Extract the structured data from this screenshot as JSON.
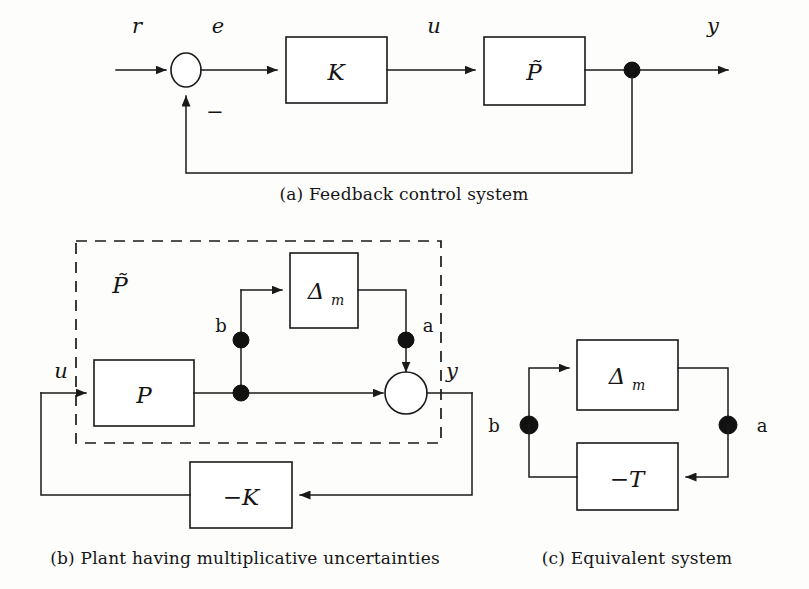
{
  "figure": {
    "background_color": "#fdfdfc",
    "line_color": "#1a1a1a"
  },
  "panel_a": {
    "caption": "(a) Feedback control system",
    "labels": {
      "reference": "r",
      "error": "e",
      "control": "u",
      "output": "y",
      "minus_sign": "−"
    },
    "blocks": [
      {
        "name": "controller",
        "label": "K"
      },
      {
        "name": "uncertain-plant",
        "label": "P̃"
      }
    ],
    "summing_junction": {
      "name": "summing-junction",
      "signs": [
        "+",
        "−"
      ]
    },
    "takeoff_node": {
      "name": "output-takeoff-node"
    }
  },
  "panel_b": {
    "caption": "(b) Plant having multiplicative uncertainties",
    "labels": {
      "input": "u",
      "output": "y",
      "node_b": "b",
      "node_a": "a",
      "dashed_group": "P̃"
    },
    "blocks": [
      {
        "name": "nominal-plant",
        "label": "P"
      },
      {
        "name": "multiplicative-uncertainty",
        "label": "Δ",
        "subscript": "m"
      },
      {
        "name": "negative-controller",
        "label": "−K"
      }
    ],
    "summing_junction": {
      "name": "summing-junction"
    },
    "nodes": [
      {
        "name": "node-b-upper"
      },
      {
        "name": "node-b-lower"
      },
      {
        "name": "node-a"
      }
    ]
  },
  "panel_c": {
    "caption": "(c) Equivalent system",
    "labels": {
      "node_b": "b",
      "node_a": "a"
    },
    "blocks": [
      {
        "name": "multiplicative-uncertainty",
        "label": "Δ",
        "subscript": "m"
      },
      {
        "name": "negative-complementary-sensitivity",
        "label": "−T"
      }
    ],
    "nodes": [
      {
        "name": "node-b"
      },
      {
        "name": "node-a"
      }
    ]
  }
}
